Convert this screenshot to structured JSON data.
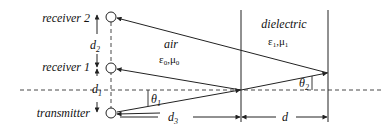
{
  "diagram": {
    "labels": {
      "receiver2": "receiver 2",
      "receiver1": "receiver 1",
      "transmitter": "transmitter",
      "d2": "d",
      "d2_sub": "2",
      "d1": "d",
      "d1_sub": "1",
      "d3": "d",
      "d3_sub": "3",
      "d": "d",
      "air": "air",
      "air_params": "ε0,μ0",
      "air_eps": "ε",
      "air_eps_sub": "0",
      "air_mu": "μ",
      "air_mu_sub": "0",
      "dielectric": "dielectric",
      "diel_eps": "ε",
      "diel_eps_sub": "1",
      "diel_mu": "μ",
      "diel_mu_sub": "1",
      "theta1": "θ",
      "theta1_sub": "1",
      "theta2": "θ",
      "theta2_sub": "2",
      "comma": ","
    },
    "colors": {
      "line": "#222222",
      "background": "#ffffff"
    }
  }
}
